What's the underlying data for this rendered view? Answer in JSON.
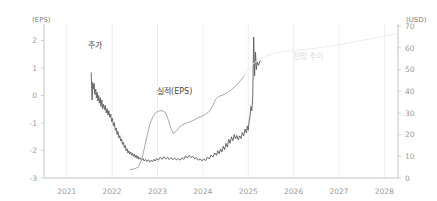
{
  "chart_data": {
    "type": "line",
    "title": "",
    "subtitle": "",
    "grid": "vertical-only",
    "legend_position": "inline-annotations",
    "xlabel": "",
    "x_tick_labels": [
      "2021",
      "2022",
      "2023",
      "2024",
      "2025",
      "2026",
      "2027",
      "2028"
    ],
    "xlim": [
      2020.5,
      2028.3
    ],
    "left_axis": {
      "unit_label": "(EPS)",
      "ylabel": "EPS",
      "ylim": [
        -3,
        2.6
      ],
      "ticks": [
        2,
        1,
        0,
        -1,
        -2,
        -3
      ],
      "tick_labels": [
        "2",
        "1",
        "0",
        "-1",
        "-2",
        "-3"
      ]
    },
    "right_axis": {
      "unit_label": "(USD)",
      "ylabel": "USD",
      "ylim": [
        0,
        71
      ],
      "ticks": [
        70,
        60,
        50,
        40,
        30,
        20,
        10,
        0
      ],
      "tick_labels": [
        "70",
        "60",
        "50",
        "40",
        "30",
        "20",
        "10",
        "0"
      ]
    },
    "annotations": [
      {
        "name": "stock-price-label",
        "text": "주가",
        "x": 2021.62,
        "value_axis": "right",
        "value": 60,
        "color": "#3a3a3a"
      },
      {
        "name": "eps-actual-label",
        "text": "실적(EPS)",
        "x": 2023.38,
        "value_axis": "left",
        "value": 0.05,
        "color": "#4a4a4a"
      },
      {
        "name": "forecast-trend-label",
        "text": "전망 추이",
        "x": 2026.32,
        "value_axis": "right",
        "value": 55,
        "color": "#dcdcdc"
      }
    ],
    "series": [
      {
        "name": "주가",
        "key": "stock_price",
        "axis": "right",
        "unit": "USD",
        "color": "#5a5a5a",
        "width": 0.9,
        "points": [
          [
            2021.54,
            48.5
          ],
          [
            2021.56,
            36.0
          ],
          [
            2021.575,
            44.0
          ],
          [
            2021.59,
            41.0
          ],
          [
            2021.605,
            43.5
          ],
          [
            2021.62,
            38.5
          ],
          [
            2021.64,
            41.0
          ],
          [
            2021.655,
            37.0
          ],
          [
            2021.67,
            39.5
          ],
          [
            2021.69,
            35.5
          ],
          [
            2021.705,
            38.0
          ],
          [
            2021.72,
            34.5
          ],
          [
            2021.74,
            37.0
          ],
          [
            2021.755,
            33.0
          ],
          [
            2021.775,
            36.0
          ],
          [
            2021.79,
            32.0
          ],
          [
            2021.81,
            34.0
          ],
          [
            2021.83,
            31.5
          ],
          [
            2021.85,
            33.5
          ],
          [
            2021.87,
            30.0
          ],
          [
            2021.89,
            32.0
          ],
          [
            2021.91,
            29.0
          ],
          [
            2021.93,
            31.0
          ],
          [
            2021.95,
            28.0
          ],
          [
            2021.97,
            29.5
          ],
          [
            2021.99,
            26.0
          ],
          [
            2022.01,
            27.5
          ],
          [
            2022.03,
            24.0
          ],
          [
            2022.05,
            25.5
          ],
          [
            2022.07,
            22.0
          ],
          [
            2022.09,
            23.0
          ],
          [
            2022.11,
            20.0
          ],
          [
            2022.13,
            21.5
          ],
          [
            2022.15,
            18.5
          ],
          [
            2022.17,
            19.5
          ],
          [
            2022.19,
            17.0
          ],
          [
            2022.21,
            18.0
          ],
          [
            2022.23,
            15.5
          ],
          [
            2022.25,
            16.5
          ],
          [
            2022.27,
            14.0
          ],
          [
            2022.29,
            15.0
          ],
          [
            2022.31,
            12.5
          ],
          [
            2022.33,
            13.5
          ],
          [
            2022.35,
            11.5
          ],
          [
            2022.37,
            12.5
          ],
          [
            2022.39,
            11.0
          ],
          [
            2022.41,
            12.0
          ],
          [
            2022.43,
            10.5
          ],
          [
            2022.45,
            11.5
          ],
          [
            2022.47,
            10.0
          ],
          [
            2022.49,
            11.0
          ],
          [
            2022.51,
            9.5
          ],
          [
            2022.53,
            10.5
          ],
          [
            2022.55,
            9.0
          ],
          [
            2022.57,
            10.0
          ],
          [
            2022.59,
            8.6
          ],
          [
            2022.62,
            9.4
          ],
          [
            2022.65,
            8.2
          ],
          [
            2022.68,
            9.0
          ],
          [
            2022.71,
            7.8
          ],
          [
            2022.74,
            8.6
          ],
          [
            2022.77,
            7.6
          ],
          [
            2022.8,
            8.4
          ],
          [
            2022.83,
            7.4
          ],
          [
            2022.86,
            8.2
          ],
          [
            2022.89,
            7.5
          ],
          [
            2022.92,
            8.6
          ],
          [
            2022.95,
            7.8
          ],
          [
            2022.98,
            9.0
          ],
          [
            2023.02,
            8.2
          ],
          [
            2023.06,
            9.6
          ],
          [
            2023.1,
            8.6
          ],
          [
            2023.14,
            9.8
          ],
          [
            2023.18,
            8.8
          ],
          [
            2023.22,
            9.6
          ],
          [
            2023.26,
            8.5
          ],
          [
            2023.3,
            9.4
          ],
          [
            2023.34,
            8.4
          ],
          [
            2023.38,
            9.2
          ],
          [
            2023.42,
            8.3
          ],
          [
            2023.46,
            9.0
          ],
          [
            2023.5,
            8.2
          ],
          [
            2023.54,
            9.4
          ],
          [
            2023.58,
            8.6
          ],
          [
            2023.62,
            10.2
          ],
          [
            2023.66,
            9.2
          ],
          [
            2023.7,
            10.4
          ],
          [
            2023.74,
            9.4
          ],
          [
            2023.78,
            10.0
          ],
          [
            2023.82,
            8.8
          ],
          [
            2023.86,
            9.4
          ],
          [
            2023.9,
            8.2
          ],
          [
            2023.94,
            8.8
          ],
          [
            2023.98,
            7.9
          ],
          [
            2024.02,
            8.8
          ],
          [
            2024.06,
            8.0
          ],
          [
            2024.1,
            9.6
          ],
          [
            2024.14,
            8.8
          ],
          [
            2024.18,
            10.6
          ],
          [
            2024.22,
            9.6
          ],
          [
            2024.26,
            11.6
          ],
          [
            2024.3,
            10.4
          ],
          [
            2024.33,
            12.6
          ],
          [
            2024.36,
            11.2
          ],
          [
            2024.39,
            13.4
          ],
          [
            2024.42,
            12.0
          ],
          [
            2024.45,
            14.6
          ],
          [
            2024.48,
            13.0
          ],
          [
            2024.51,
            16.0
          ],
          [
            2024.54,
            14.2
          ],
          [
            2024.57,
            17.8
          ],
          [
            2024.6,
            16.0
          ],
          [
            2024.63,
            19.0
          ],
          [
            2024.66,
            17.2
          ],
          [
            2024.69,
            20.0
          ],
          [
            2024.72,
            18.0
          ],
          [
            2024.75,
            19.6
          ],
          [
            2024.78,
            17.6
          ],
          [
            2024.81,
            19.4
          ],
          [
            2024.84,
            18.2
          ],
          [
            2024.87,
            21.0
          ],
          [
            2024.9,
            19.4
          ],
          [
            2024.93,
            22.6
          ],
          [
            2024.96,
            20.8
          ],
          [
            2024.98,
            24.0
          ],
          [
            2025.0,
            22.0
          ],
          [
            2025.02,
            26.0
          ],
          [
            2025.04,
            28.5
          ],
          [
            2025.06,
            33.0
          ],
          [
            2025.08,
            31.0
          ],
          [
            2025.1,
            38.0
          ],
          [
            2025.12,
            65.0
          ],
          [
            2025.14,
            47.0
          ],
          [
            2025.16,
            58.0
          ],
          [
            2025.18,
            50.0
          ],
          [
            2025.2,
            53.5
          ],
          [
            2025.23,
            52.0
          ],
          [
            2025.26,
            54.0
          ]
        ]
      },
      {
        "name": "실적(EPS)",
        "key": "eps_actual",
        "axis": "left",
        "unit": "EPS",
        "color": "#9e9e9e",
        "width": 0.9,
        "points": [
          [
            2022.4,
            -2.7
          ],
          [
            2022.5,
            -2.66
          ],
          [
            2022.58,
            -2.6
          ],
          [
            2022.66,
            -2.3
          ],
          [
            2022.72,
            -1.85
          ],
          [
            2022.78,
            -1.4
          ],
          [
            2022.84,
            -1.0
          ],
          [
            2022.9,
            -0.78
          ],
          [
            2022.96,
            -0.62
          ],
          [
            2023.02,
            -0.57
          ],
          [
            2023.1,
            -0.55
          ],
          [
            2023.18,
            -0.62
          ],
          [
            2023.24,
            -0.9
          ],
          [
            2023.3,
            -1.2
          ],
          [
            2023.35,
            -1.38
          ],
          [
            2023.41,
            -1.3
          ],
          [
            2023.48,
            -1.16
          ],
          [
            2023.56,
            -1.06
          ],
          [
            2023.64,
            -1.0
          ],
          [
            2023.74,
            -0.94
          ],
          [
            2023.84,
            -0.86
          ],
          [
            2023.94,
            -0.78
          ],
          [
            2024.04,
            -0.7
          ],
          [
            2024.14,
            -0.58
          ],
          [
            2024.22,
            -0.36
          ],
          [
            2024.28,
            -0.14
          ],
          [
            2024.34,
            -0.04
          ],
          [
            2024.44,
            0.02
          ],
          [
            2024.54,
            0.1
          ],
          [
            2024.64,
            0.22
          ],
          [
            2024.74,
            0.38
          ],
          [
            2024.84,
            0.56
          ],
          [
            2024.92,
            0.72
          ]
        ]
      },
      {
        "name": "전망 추이",
        "key": "forecast_trend",
        "axis": "right",
        "unit": "USD",
        "color": "#ebebeb",
        "width": 0.9,
        "points": [
          [
            2024.9,
            47.0
          ],
          [
            2025.0,
            50.0
          ],
          [
            2025.1,
            52.5
          ],
          [
            2025.22,
            54.5
          ],
          [
            2025.36,
            56.0
          ],
          [
            2025.52,
            57.2
          ],
          [
            2025.7,
            58.0
          ],
          [
            2025.9,
            58.6
          ],
          [
            2026.1,
            59.0
          ],
          [
            2026.35,
            59.5
          ],
          [
            2026.6,
            60.2
          ],
          [
            2026.9,
            61.0
          ],
          [
            2027.2,
            62.2
          ],
          [
            2027.5,
            63.4
          ],
          [
            2027.8,
            64.6
          ],
          [
            2028.1,
            65.8
          ],
          [
            2028.25,
            66.4
          ]
        ]
      }
    ]
  }
}
